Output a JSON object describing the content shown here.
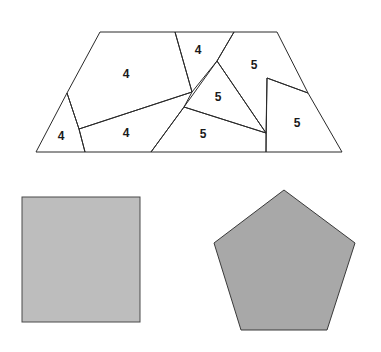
{
  "colors": {
    "light": "#c2c2c2",
    "dark": "#a9a9a9",
    "square": "#bdbdbd",
    "pentagon": "#a8a8a8",
    "stroke": "#2a2a2a"
  },
  "trapezoid": {
    "pieces": [
      {
        "id": "A",
        "label": "4",
        "shade": "light"
      },
      {
        "id": "B",
        "label": "4",
        "shade": "light"
      },
      {
        "id": "C",
        "label": "4",
        "shade": "light"
      },
      {
        "id": "D",
        "label": "4",
        "shade": "light"
      },
      {
        "id": "E",
        "label": "5",
        "shade": "dark"
      },
      {
        "id": "F",
        "label": "5",
        "shade": "dark"
      },
      {
        "id": "G",
        "label": "5",
        "shade": "dark"
      },
      {
        "id": "H",
        "label": "5",
        "shade": "dark"
      }
    ]
  },
  "square": {
    "label": ""
  },
  "pentagon": {
    "label": ""
  }
}
